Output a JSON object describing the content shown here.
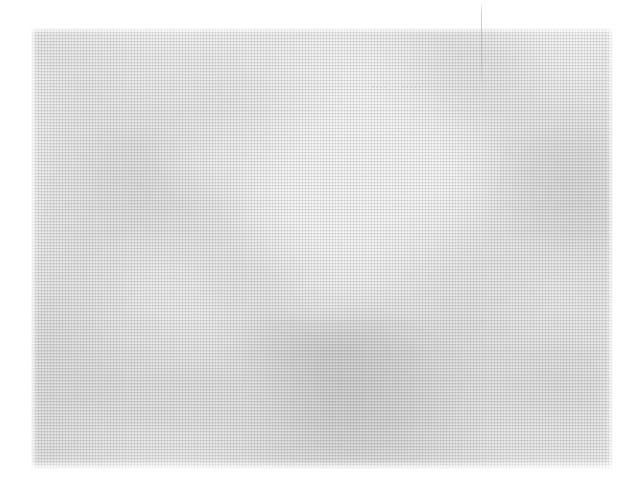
{
  "image": {
    "kind": "faded-halftone-scan",
    "description": "Very pale, low-contrast halftone-printed photograph showing soft diagonal X-shaped tonal bands",
    "page_background": "#ffffff",
    "print_area": {
      "left": 31,
      "top": 28,
      "width": 582,
      "height": 441
    },
    "tone": {
      "lightest": "#ffffff",
      "paper": "#fdfdfd",
      "midtone": "#e4e4e4",
      "darkest": "#c3c3c3",
      "ink": "#6e6e6e"
    },
    "halftone": {
      "cell_size_px": 3,
      "dot_color": "#6e6e6e",
      "screen_angle_deg": 0
    },
    "structure": {
      "pattern": "crossed diagonal bands forming an X",
      "band_angle_deg": 48,
      "highlight_center_pct": {
        "x": 50,
        "y": 42
      },
      "dark_mass_center_pct": {
        "x": 50,
        "y": 82
      }
    }
  },
  "ghost_caption": {
    "visible": true,
    "words": [
      "....",
      "....."
    ],
    "color": "#787878",
    "opacity": 0.16
  },
  "hairline_artifact": {
    "visible": true,
    "orientation": "vertical",
    "left": 481,
    "top": 0,
    "height": 85,
    "color": "#a8a8a8"
  }
}
